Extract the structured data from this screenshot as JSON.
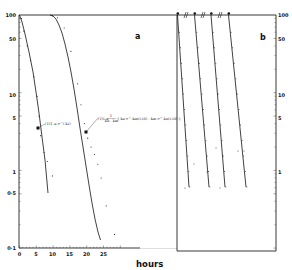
{
  "chart_data": [
    {
      "panel": "a",
      "type": "line",
      "title": "",
      "xlabel": "hours",
      "ylabel": "",
      "yscale": "log",
      "ylim": [
        0.1,
        100
      ],
      "xlim": [
        0,
        30
      ],
      "grid": false,
      "x_ticks": [
        "0",
        "5",
        "10",
        "15",
        "20",
        "25"
      ],
      "y_ticks": [
        "100",
        "50",
        "10",
        "5",
        "1",
        "0.5",
        "0.1"
      ],
      "panel_label": "a",
      "annotations": [
        {
          "text": "(T)1 = e^(-kt)",
          "anchor": [
            5.5,
            3.5
          ]
        },
        {
          "text": "(T)t = 1/(kn - km) { kn e^(-km(t - t0)) - km e^(-kn(t - t0)) }",
          "anchor": [
            19,
            2.3
          ]
        }
      ],
      "series": [
        {
          "name": "curve 1 (fit)",
          "style": "solid line",
          "x": [
            0,
            1,
            2,
            3,
            4,
            5,
            6,
            7,
            8.5
          ],
          "y": [
            100,
            68,
            45,
            30,
            20,
            13,
            6,
            2.5,
            0.55
          ]
        },
        {
          "name": "curve 1 (observed)",
          "style": "dots",
          "x": [
            0.3,
            1,
            2,
            3,
            4,
            5,
            5.5,
            6,
            7,
            8,
            9.5
          ],
          "y": [
            90,
            62,
            40,
            26,
            16,
            9,
            5,
            2.8,
            1.7,
            1.3,
            0.85
          ]
        },
        {
          "name": "curve 2 (fit)",
          "style": "solid line",
          "x": [
            9,
            10,
            11,
            12,
            13,
            14,
            15,
            16,
            17,
            18,
            19,
            20,
            21,
            22,
            23,
            24,
            25.5
          ],
          "y": [
            100,
            99,
            95,
            85,
            70,
            52,
            35,
            22,
            14,
            8,
            4.5,
            2.5,
            1.4,
            0.8,
            0.5,
            0.32,
            0.2
          ]
        },
        {
          "name": "curve 2 (observed)",
          "style": "dots",
          "x": [
            9.5,
            11,
            13,
            15,
            17,
            18,
            19,
            20,
            21,
            22,
            23,
            24,
            25.5,
            28
          ],
          "y": [
            98,
            92,
            68,
            34,
            13,
            7,
            4,
            2.6,
            2,
            1.6,
            1.2,
            0.8,
            0.35,
            0.15
          ]
        }
      ]
    },
    {
      "panel": "b",
      "type": "line",
      "title": "",
      "xlabel": "hours",
      "yscale": "log",
      "ylim": [
        0.1,
        100
      ],
      "grid": false,
      "y_ticks": [
        "100",
        "50",
        "10",
        "5",
        "1"
      ],
      "panel_label": "b",
      "axis_breaks": 3,
      "series": [
        {
          "name": "decay 1",
          "style": "solid line with dots",
          "start_marker": true,
          "y_range": [
            100,
            0.5
          ]
        },
        {
          "name": "decay 2",
          "style": "solid line with dots",
          "start_marker": true,
          "y_range": [
            100,
            0.5
          ]
        },
        {
          "name": "decay 3",
          "style": "solid line with dots",
          "start_marker": true,
          "y_range": [
            100,
            0.5
          ]
        },
        {
          "name": "decay 4",
          "style": "solid line with dots",
          "start_marker": true,
          "y_range": [
            100,
            0.5
          ]
        }
      ]
    }
  ],
  "labels": {
    "panel_a": "a",
    "panel_b": "b",
    "x_axis_title": "hours",
    "eq1": "(T)1 = e^(-kt)",
    "eq2a": "(T)t = ",
    "eq2b": "kn - km",
    "eq2c": "{ kn e^-km(t-t0) - km e^-kn(t-t0) }",
    "eq2num": "1"
  },
  "left_axis": {
    "ticks": [
      {
        "label": "100",
        "value": 100
      },
      {
        "label": "50",
        "value": 50
      },
      {
        "label": "10",
        "value": 10
      },
      {
        "label": "5",
        "value": 5
      },
      {
        "label": "1",
        "value": 1
      },
      {
        "label": "0·5",
        "value": 0.5
      },
      {
        "label": "0·1",
        "value": 0.1
      }
    ]
  },
  "right_axis": {
    "ticks": [
      {
        "label": "100",
        "value": 100
      },
      {
        "label": "50",
        "value": 50
      },
      {
        "label": "10",
        "value": 10
      },
      {
        "label": "5",
        "value": 5
      },
      {
        "label": "1",
        "value": 1
      }
    ]
  },
  "x_axis": {
    "ticks": [
      {
        "label": "0",
        "value": 0
      },
      {
        "label": "5",
        "value": 5
      },
      {
        "label": "10",
        "value": 10
      },
      {
        "label": "15",
        "value": 15
      },
      {
        "label": "20",
        "value": 20
      },
      {
        "label": "25",
        "value": 25
      }
    ]
  }
}
